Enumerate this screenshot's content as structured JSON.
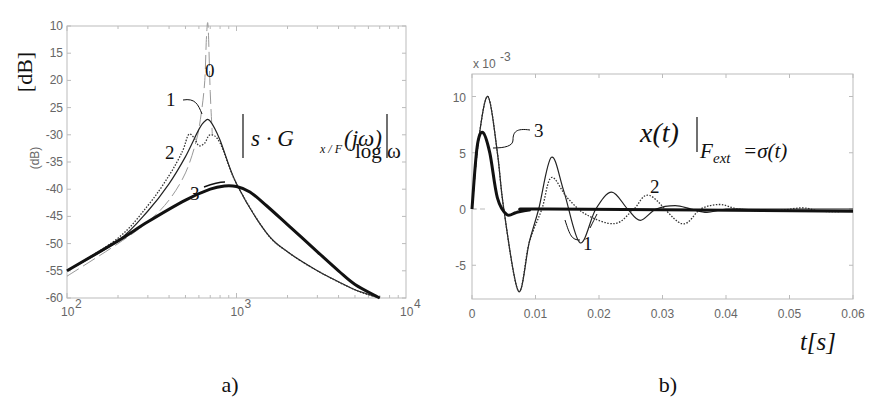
{
  "figure": {
    "panels": [
      {
        "id": "a",
        "caption": "a)"
      },
      {
        "id": "b",
        "caption": "b)"
      }
    ]
  },
  "chart_data": [
    {
      "type": "line",
      "panel": "a)",
      "title": "|s·G_{x/F}(jω)|",
      "title_parts": {
        "main": "s · G",
        "sub": "x / F",
        "arg": "(jω)"
      },
      "xlabel": "log ω",
      "ylabel": "[dB]",
      "ylabel_small": "(dB)",
      "xscale": "log",
      "xlim": [
        100,
        10000
      ],
      "ylim": [
        -60,
        -10
      ],
      "xticks": [
        100,
        1000,
        10000
      ],
      "xtick_labels": [
        {
          "base": "10",
          "exp": "2"
        },
        {
          "base": "10",
          "exp": "3"
        },
        {
          "base": "10",
          "exp": "4"
        }
      ],
      "yticks": [
        -10,
        -15,
        -20,
        -25,
        -30,
        -35,
        -40,
        -45,
        -50,
        -55,
        -60
      ],
      "ytick_labels": [
        "10",
        "15",
        "20",
        "25",
        "-30",
        "-35",
        "-40",
        "-45",
        "-50",
        "-55",
        "-60"
      ],
      "grid": false,
      "series": [
        {
          "name": "0",
          "style": "dashed-thin-gray",
          "x": [
            100,
            200,
            300,
            400,
            500,
            580,
            620,
            650,
            665,
            680,
            700,
            720
          ],
          "y": [
            -56,
            -50,
            -46,
            -42,
            -37,
            -31,
            -26,
            -20,
            -12,
            -10,
            -22,
            -30
          ]
        },
        {
          "name": "1",
          "style": "solid-thin",
          "x": [
            100,
            200,
            300,
            400,
            500,
            600,
            650,
            700,
            800,
            1000,
            1500,
            2000,
            3000,
            4000,
            5000,
            7000
          ],
          "y": [
            -55,
            -49.5,
            -44,
            -39,
            -34,
            -29,
            -27.5,
            -27.5,
            -31,
            -39,
            -48,
            -51.5,
            -55,
            -57,
            -58.5,
            -60
          ]
        },
        {
          "name": "2",
          "style": "dotted",
          "x": [
            100,
            200,
            300,
            400,
            480,
            520,
            560,
            600,
            650,
            700,
            800,
            1000,
            1500,
            2000,
            3000,
            5000,
            7000
          ],
          "y": [
            -55,
            -49,
            -43,
            -37.5,
            -33,
            -30,
            -30.5,
            -32,
            -31.5,
            -30,
            -31.5,
            -39,
            -48,
            -51.5,
            -55,
            -58.5,
            -60
          ]
        },
        {
          "name": "3",
          "style": "solid-thick",
          "x": [
            100,
            200,
            300,
            500,
            700,
            850,
            1000,
            1200,
            1500,
            2000,
            3000,
            4000,
            5000,
            7000
          ],
          "y": [
            -55,
            -49.5,
            -46,
            -42,
            -40,
            -39.4,
            -39.5,
            -40.5,
            -43,
            -46.5,
            -51.5,
            -55,
            -57.5,
            -60
          ]
        }
      ],
      "annotations": [
        "0",
        "1",
        "2",
        "3"
      ]
    },
    {
      "type": "line",
      "panel": "b)",
      "title": "x(t)|_{F_ext=σ(t)}",
      "title_parts": {
        "main": "x(t)",
        "sub": "F",
        "subsub": "ext",
        "rest": "=σ(t)"
      },
      "xlabel": "t[s]",
      "ylabel": "",
      "y_multiplier": "x 10",
      "y_multiplier_exp": "-3",
      "xlim": [
        0,
        0.06
      ],
      "ylim": [
        -8,
        12
      ],
      "xticks": [
        0,
        0.01,
        0.02,
        0.03,
        0.04,
        0.05,
        0.06
      ],
      "xtick_labels": [
        "0",
        "0.01",
        "0.02",
        "0.03",
        "0.04",
        "0.05",
        "0.06"
      ],
      "yticks": [
        10,
        5,
        0,
        -5
      ],
      "ytick_labels": [
        "10",
        "5",
        "0",
        "-5"
      ],
      "grid": false,
      "series": [
        {
          "name": "1",
          "style": "solid-thin",
          "x": [
            0,
            0.001,
            0.0025,
            0.004,
            0.005,
            0.0073,
            0.009,
            0.0105,
            0.0125,
            0.0145,
            0.017,
            0.0195,
            0.022,
            0.0245,
            0.0265,
            0.029,
            0.032,
            0.0345,
            0.037,
            0.04,
            0.045,
            0.06
          ],
          "y": [
            0,
            6,
            10,
            5,
            0,
            -7.3,
            -3,
            0,
            4.6,
            1.5,
            -3,
            0,
            1.5,
            0,
            -1,
            0,
            0.3,
            0,
            -0.3,
            0,
            0,
            0
          ]
        },
        {
          "name": "2",
          "style": "dotted",
          "x": [
            0,
            0.001,
            0.0025,
            0.004,
            0.005,
            0.0073,
            0.009,
            0.011,
            0.0125,
            0.015,
            0.018,
            0.0225,
            0.0255,
            0.028,
            0.033,
            0.036,
            0.039,
            0.042,
            0.047,
            0.052,
            0.055,
            0.06
          ],
          "y": [
            0,
            6,
            10,
            5,
            0,
            -7.3,
            -3,
            0,
            2.8,
            1,
            -0.5,
            -1.3,
            0,
            1.2,
            -1.3,
            0,
            0.4,
            0,
            -0.2,
            0.1,
            -0.2,
            -0.2
          ]
        },
        {
          "name": "3",
          "style": "solid-thick",
          "x": [
            0,
            0.0008,
            0.0017,
            0.0028,
            0.004,
            0.0055,
            0.007,
            0.009,
            0.012,
            0.06
          ],
          "y": [
            0,
            5.5,
            6.8,
            5,
            1,
            -0.5,
            -0.3,
            -0.1,
            0,
            -0.2
          ]
        }
      ],
      "annotations": [
        "1",
        "2",
        "3"
      ]
    }
  ]
}
